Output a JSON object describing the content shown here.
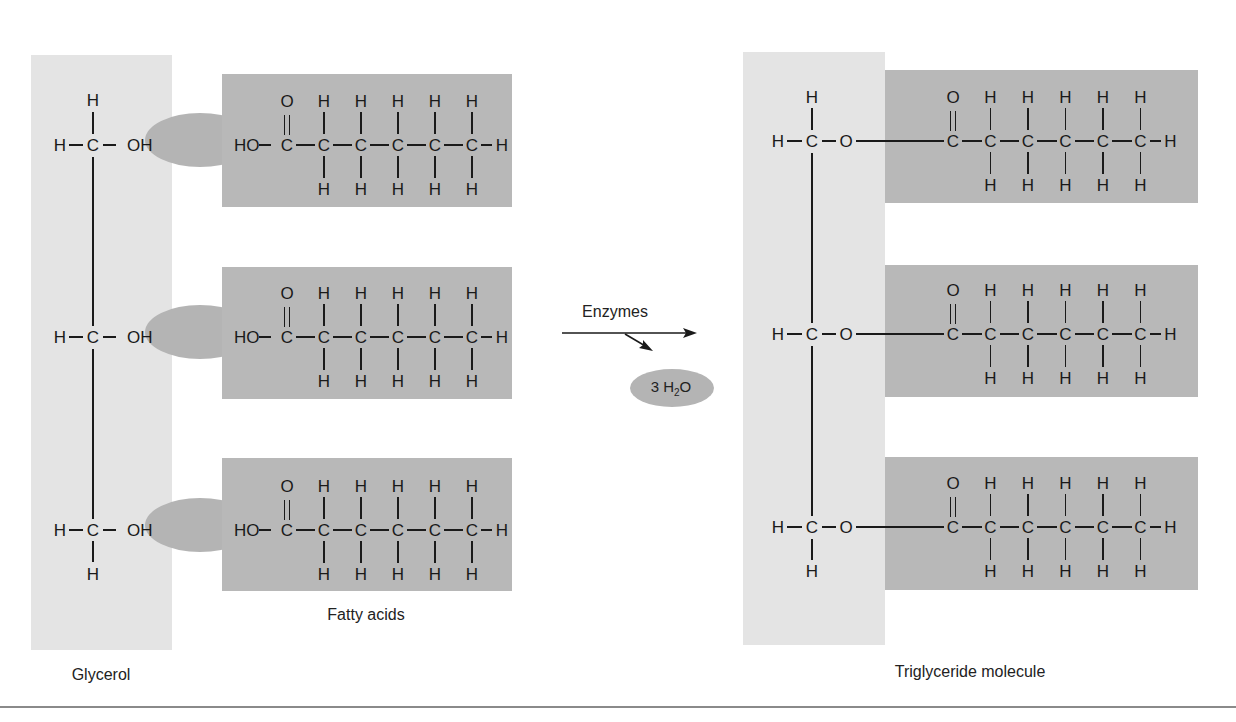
{
  "figure": {
    "labels": {
      "glycerol": "Glycerol",
      "fatty_acids": "Fatty acids",
      "triglyceride": "Triglyceride molecule",
      "enzymes": "Enzymes",
      "water_count": "3 H",
      "water_sub": "2",
      "water_tail": "O"
    },
    "atoms": {
      "H": "H",
      "C": "C",
      "O": "O",
      "OH": "OH",
      "HO": "HO"
    },
    "colors": {
      "glycerol_box": "#e4e4e4",
      "fatty_acid_box": "#b8b8b8",
      "oval": "#b4b4b4",
      "bond": "#1a1a1a"
    },
    "fatty_acid_chain_carbons": 6,
    "rows": 3
  }
}
